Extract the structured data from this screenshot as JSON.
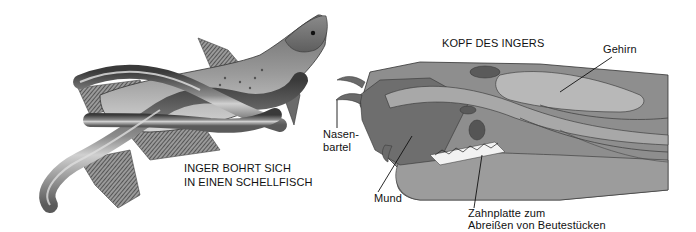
{
  "left_illustration": {
    "caption_line1": "INGER BOHRT SICH",
    "caption_line2": "IN EINEN SCHELLFISCH"
  },
  "right_illustration": {
    "title": "KOPF DES INGERS",
    "labels": {
      "brain": "Gehirn",
      "barbel_line1": "Nasen-",
      "barbel_line2": "bartel",
      "mouth": "Mund",
      "tooth_plate_line1": "Zahnplatte zum",
      "tooth_plate_line2": "Abreißen von Beutestücken"
    }
  },
  "colors": {
    "background": "#ffffff",
    "ink": "#111111"
  }
}
